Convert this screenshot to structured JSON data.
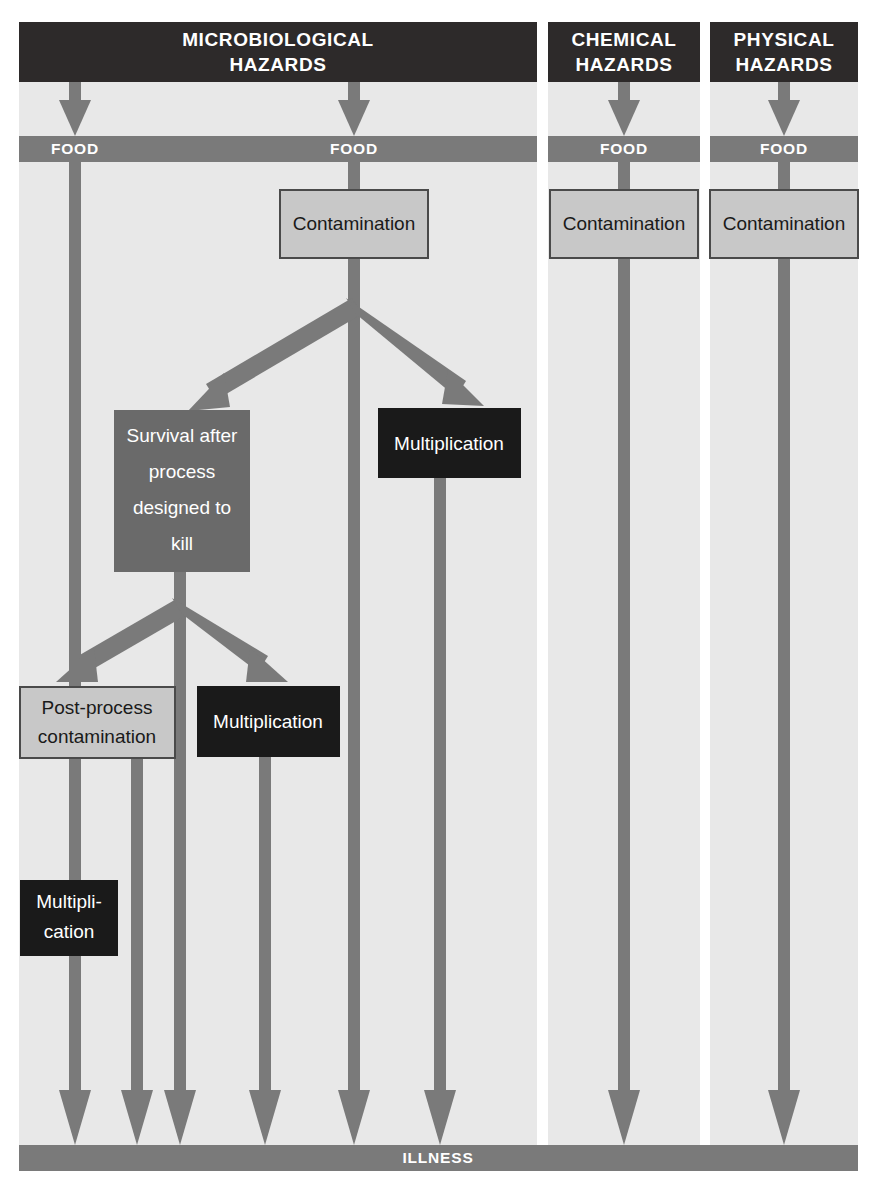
{
  "diagram": {
    "title_hidden": "Routes by which hazards cause illness",
    "canvas": {
      "width": 878,
      "height": 1201,
      "background": "#ffffff"
    },
    "colors": {
      "header_fill": "#2d2a2a",
      "panel_bg": "#e8e8e8",
      "bar_fill": "#7a7a7a",
      "arrow": "#7a7a7a",
      "box_light": "#c8c8c8",
      "box_light_border": "#4a4a4a",
      "box_medium": "#6a6a6a",
      "box_dark": "#1a1a1a",
      "text_on_light": "#1a1a1a",
      "text_on_dark": "#ffffff"
    },
    "columns": [
      {
        "id": "microbiological",
        "header": "MICROBIOLOGICAL HAZARDS",
        "header_line1": "MICROBIOLOGICAL",
        "header_line2": "HAZARDS",
        "food_labels": [
          "FOOD",
          "FOOD"
        ],
        "nodes": [
          {
            "id": "micro-contamination",
            "label": "Contamination",
            "style": "light"
          },
          {
            "id": "micro-survival",
            "label": "Survival after process designed to kill",
            "style": "medium",
            "lines": [
              "Survival after",
              "process",
              "designed to",
              "kill"
            ]
          },
          {
            "id": "micro-multiplication-1",
            "label": "Multiplication",
            "style": "dark"
          },
          {
            "id": "micro-post-process-contamination",
            "label": "Post-process contamination",
            "style": "light",
            "lines": [
              "Post-process",
              "contamination"
            ]
          },
          {
            "id": "micro-multiplication-2",
            "label": "Multiplication",
            "style": "dark"
          },
          {
            "id": "micro-multiplication-3",
            "label": "Multiplication",
            "style": "dark",
            "lines": [
              "Multipli-",
              "cation"
            ]
          }
        ]
      },
      {
        "id": "chemical",
        "header": "CHEMICAL HAZARDS",
        "header_line1": "CHEMICAL",
        "header_line2": "HAZARDS",
        "food_labels": [
          "FOOD"
        ],
        "nodes": [
          {
            "id": "chem-contamination",
            "label": "Contamination",
            "style": "light"
          }
        ]
      },
      {
        "id": "physical",
        "header": "PHYSICAL HAZARDS",
        "header_line1": "PHYSICAL",
        "header_line2": "HAZARDS",
        "food_labels": [
          "FOOD"
        ],
        "nodes": [
          {
            "id": "phys-contamination",
            "label": "Contamination",
            "style": "light"
          }
        ]
      }
    ],
    "outcome_bar": {
      "id": "illness-bar",
      "label": "ILLNESS"
    }
  }
}
